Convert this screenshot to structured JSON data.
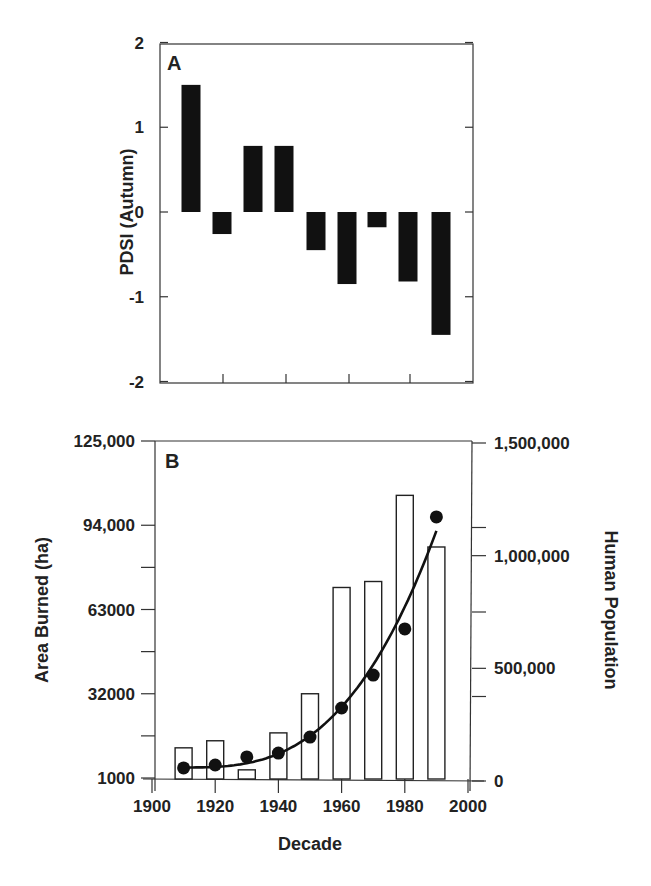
{
  "chart_data": [
    {
      "panel": "A",
      "type": "bar",
      "ylabel": "PDSI (Autumn)",
      "xlabel": "",
      "ylim": [
        -2,
        2
      ],
      "yticks": [
        "2",
        "1",
        "0",
        "-1",
        "-2"
      ],
      "categories": [
        "1910",
        "1920",
        "1930",
        "1940",
        "1950",
        "1960",
        "1970",
        "1980",
        "1990"
      ],
      "values": [
        1.5,
        -0.26,
        0.78,
        0.78,
        -0.45,
        -0.85,
        -0.18,
        -0.82,
        -1.45
      ],
      "bar_color": "#111111",
      "grid": false
    },
    {
      "panel": "B",
      "type": "bar+line",
      "xlabel": "Decade",
      "ylabel": "Area Burned (ha)",
      "y2label": "Human Population",
      "xlim": [
        1900,
        2000
      ],
      "xticks": [
        "1900",
        "1920",
        "1940",
        "1960",
        "1980",
        "2000"
      ],
      "ylim": [
        1000,
        125000
      ],
      "yticks": [
        "125,000",
        "94,000",
        "63000",
        "32000",
        "1000"
      ],
      "y2lim": [
        0,
        1500000
      ],
      "y2ticks": [
        "1,500,000",
        "1,000,000",
        "500,000",
        "0"
      ],
      "categories": [
        "1910",
        "1920",
        "1930",
        "1940",
        "1950",
        "1960",
        "1970",
        "1980",
        "1990"
      ],
      "series": [
        {
          "name": "Area Burned (ha)",
          "type": "bar",
          "axis": "left",
          "fill": "#ffffff",
          "stroke": "#222222",
          "values": [
            12100,
            14700,
            4000,
            17600,
            32000,
            71100,
            73300,
            105000,
            86000
          ]
        },
        {
          "name": "Human Population",
          "type": "scatter",
          "axis": "right",
          "color": "#111111",
          "values": [
            58000,
            71000,
            107000,
            124000,
            195000,
            324000,
            470000,
            675000,
            1172000
          ]
        },
        {
          "name": "Population trend",
          "type": "line",
          "axis": "right",
          "color": "#111111",
          "note": "smooth polynomial fit through population points"
        }
      ],
      "grid": false
    }
  ]
}
